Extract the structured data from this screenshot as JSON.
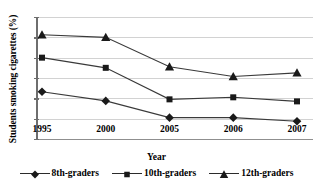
{
  "chart_data": {
    "type": "line",
    "title": "",
    "xlabel": "Year",
    "ylabel": "Students smoking cigarettes (%)",
    "categories": [
      "1995",
      "2000",
      "2005",
      "2006",
      "2007"
    ],
    "ylim": [
      0,
      24
    ],
    "yticks": [
      "0",
      "4",
      "8",
      "12",
      "16",
      "20",
      "24"
    ],
    "grid": true,
    "legend_position": "bottom",
    "series": [
      {
        "name": "8th-graders",
        "marker": "diamond",
        "color": "#1a1a1a",
        "values": [
          9.3,
          7.5,
          4.2,
          4.2,
          3.5
        ]
      },
      {
        "name": "10th-graders",
        "marker": "square",
        "color": "#1a1a1a",
        "values": [
          16.0,
          14.0,
          7.8,
          8.2,
          7.4
        ]
      },
      {
        "name": "12th-graders",
        "marker": "triangle",
        "color": "#1a1a1a",
        "values": [
          20.5,
          20.0,
          14.2,
          12.3,
          13.0
        ]
      }
    ]
  },
  "title_remnant": "",
  "axis": {
    "y_title": "Students smoking cigarettes (%)",
    "x_title": "Year"
  }
}
